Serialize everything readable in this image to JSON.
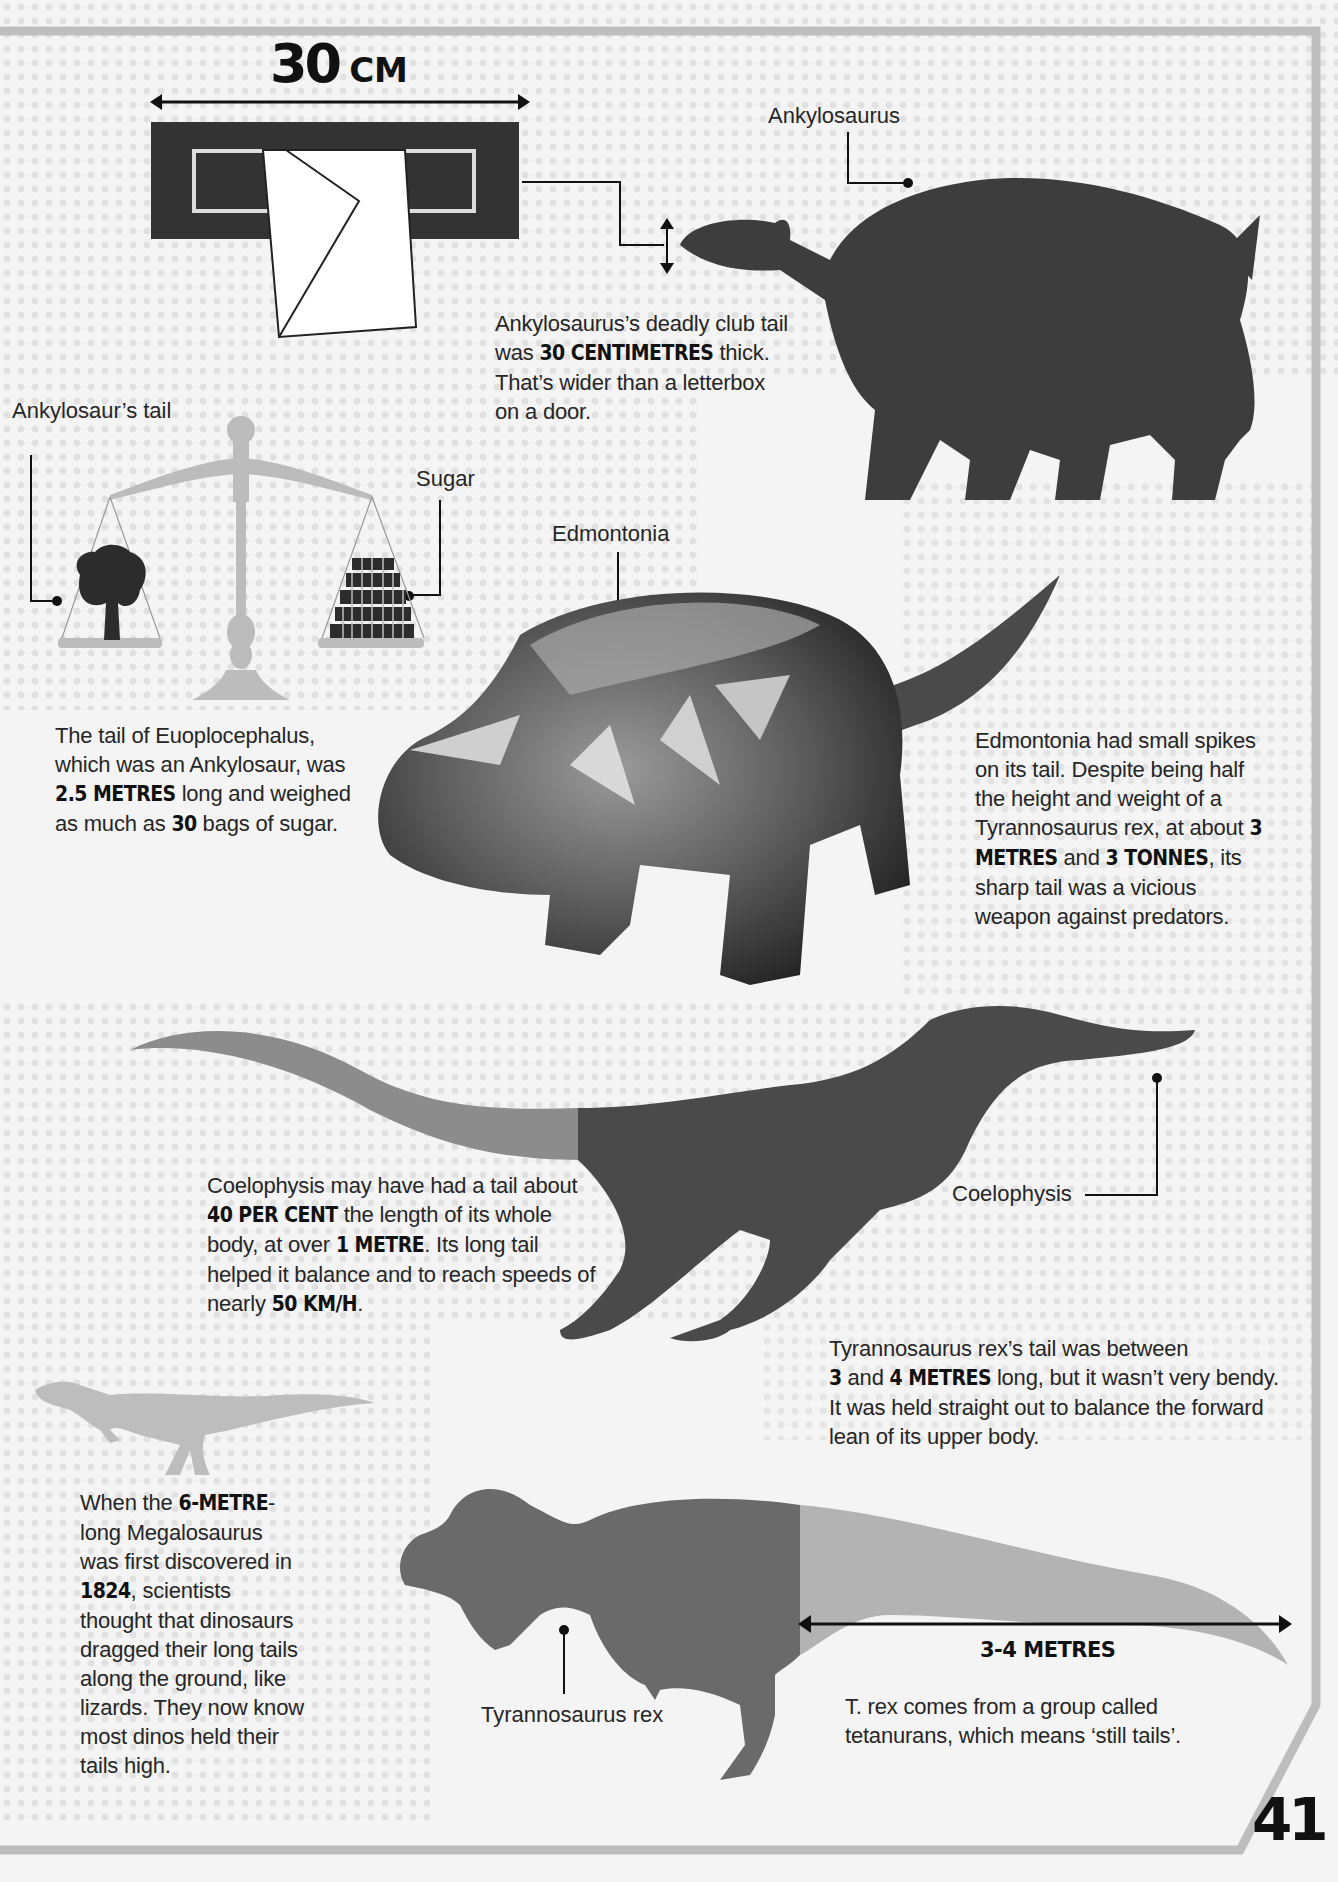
{
  "page": {
    "number": "41"
  },
  "colors": {
    "background": "#f4f4f4",
    "dark_silhouette": "#3d3d3d",
    "mid_gray": "#6a6a6a",
    "light_gray": "#b3b3b3",
    "frame_gray": "#bdbdbd",
    "text": "#262626"
  },
  "letterbox": {
    "measure_value": "30",
    "measure_unit": "CM"
  },
  "ankylosaurus": {
    "label": "Ankylosaurus",
    "fact": {
      "pre": "Ankylosaurus’s deadly club tail was ",
      "bold": "30 CENTIMETRES",
      "post": " thick. That’s wider than a letterbox on a door."
    }
  },
  "scale": {
    "left_label": "Ankylosaur’s tail",
    "right_label": "Sugar",
    "fact": {
      "line1": "The tail of Euoplocephalus,",
      "line2": "which was an Ankylosaur, was",
      "bold1": "2.5 METRES",
      "mid": " long and weighed",
      "pre2": "as much as ",
      "bold2": "30",
      "post": " bags of sugar."
    }
  },
  "edmontonia": {
    "label": "Edmontonia",
    "fact": {
      "pre": "Edmontonia had small spikes on its tail. Despite being half the height and weight of a Tyrannosaurus rex, at about ",
      "bold1": "3 METRES",
      "mid": " and ",
      "bold2": "3 TONNES",
      "post": ", its sharp tail was a vicious weapon against predators."
    }
  },
  "coelophysis": {
    "label": "Coelophysis",
    "fact": {
      "pre": "Coelophysis may have had a tail about ",
      "bold1": "40 PER CENT",
      "mid1": " the length of its whole body, at over ",
      "bold2": "1 METRE",
      "mid2": ". Its long tail helped it balance and to reach speeds of nearly ",
      "bold3": "50 KM/H",
      "post": "."
    }
  },
  "megalosaurus": {
    "fact": {
      "pre": "When the ",
      "bold1": "6-METRE",
      "mid1": "-long Megalosaurus was first discovered in ",
      "bold2": "1824",
      "post": ", scientists thought that dinosaurs dragged their long tails along the ground, like lizards. They now know most dinos held their tails high."
    }
  },
  "trex": {
    "label": "Tyrannosaurus rex",
    "fact": {
      "bold1": "3",
      "mid": " and ",
      "bold2": "4 METRES",
      "pre": "Tyrannosaurus rex’s tail was between",
      "post": " long, but it wasn’t very bendy. It was held straight out to balance the forward lean of its upper body."
    },
    "measure_label": "3-4 METRES",
    "note": "T. rex comes from a group called tetanurans, which means ‘still tails’."
  }
}
